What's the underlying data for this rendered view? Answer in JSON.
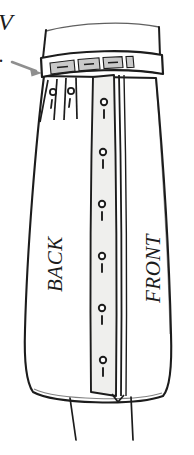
{
  "diagram": {
    "type": "fashion-technical-drawing",
    "garment": "skirt",
    "view": "three-quarter flat",
    "background_color": "#ffffff",
    "ink_color": "#1c1c1c",
    "panel_fill": "#ffffff",
    "placket_fill": "#efefed",
    "waistband_segment_fill": "#c9c9c9",
    "annotation_arrow_color": "#8f8f8f"
  },
  "labels": {
    "back_panel": "BACK",
    "front_panel": "FRONT",
    "cropped_caption_glyph": "V",
    "cropped_caption_dot": "."
  },
  "annotations": {
    "waistband_pointer": {
      "name": "waistband-callout-arrow",
      "direction": "right",
      "target": "waistband",
      "color": "#8f8f8f"
    }
  },
  "details": {
    "waistband": {
      "name": "waistband",
      "segments": 4,
      "has_belt_loops": true,
      "shaded": true
    },
    "placket": {
      "name": "button-placket",
      "position": "center-front",
      "button_count": 6,
      "marker_glyph": "circle-and-dash"
    },
    "darts": {
      "name": "hip-darts",
      "count": 2,
      "side": "left",
      "marker_glyph": "circle-and-dash"
    },
    "hem": {
      "name": "hem",
      "shape": "curved",
      "has_center_vent": true,
      "leg_lines": 2
    }
  }
}
